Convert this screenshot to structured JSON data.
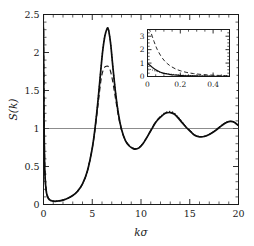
{
  "chart_data": {
    "type": "line",
    "title": "",
    "xlabel": "kσ",
    "ylabel": "S(k)",
    "xlim": [
      0,
      20
    ],
    "ylim": [
      0,
      2.5
    ],
    "grid": false,
    "legend_position": "none",
    "reference_lines": [
      {
        "axis": "y",
        "value": 1,
        "style": "solid-thin"
      }
    ],
    "x_ticks": [
      0,
      5,
      10,
      15,
      20
    ],
    "x_tick_labels": [
      "0",
      "5",
      "10",
      "15",
      "20"
    ],
    "x_minor_tick_step": 1,
    "y_ticks": [
      0,
      0.5,
      1,
      1.5,
      2,
      2.5
    ],
    "y_tick_labels": [
      "0",
      "0.5",
      "1",
      "1.5",
      "2",
      "2.5"
    ],
    "y_minor_tick_step": 0.1,
    "series": [
      {
        "name": "solid",
        "style": "solid",
        "x": [
          0.0,
          0.05,
          0.1,
          0.15,
          0.2,
          0.3,
          0.4,
          0.5,
          0.7,
          0.9,
          1.2,
          1.6,
          2.0,
          2.5,
          3.0,
          3.5,
          4.0,
          4.5,
          5.0,
          5.3,
          5.6,
          5.9,
          6.1,
          6.3,
          6.5,
          6.6,
          6.7,
          6.9,
          7.1,
          7.4,
          7.7,
          8.0,
          8.4,
          8.8,
          9.2,
          9.5,
          9.8,
          10.2,
          10.6,
          11.0,
          11.5,
          12.0,
          12.5,
          13.0,
          13.4,
          13.8,
          14.2,
          14.6,
          15.0,
          15.5,
          16.0,
          16.5,
          17.0,
          17.5,
          18.0,
          18.5,
          19.0,
          19.4,
          19.7,
          20.0
        ],
        "y": [
          2.32,
          1.15,
          0.62,
          0.4,
          0.28,
          0.16,
          0.11,
          0.08,
          0.055,
          0.046,
          0.042,
          0.047,
          0.058,
          0.082,
          0.118,
          0.175,
          0.27,
          0.44,
          0.74,
          1.02,
          1.38,
          1.8,
          2.05,
          2.22,
          2.31,
          2.32,
          2.28,
          2.1,
          1.83,
          1.46,
          1.18,
          0.99,
          0.84,
          0.77,
          0.735,
          0.73,
          0.745,
          0.8,
          0.88,
          0.97,
          1.08,
          1.15,
          1.2,
          1.21,
          1.19,
          1.14,
          1.08,
          1.02,
          0.97,
          0.91,
          0.89,
          0.895,
          0.92,
          0.96,
          1.01,
          1.06,
          1.09,
          1.09,
          1.07,
          1.04
        ]
      },
      {
        "name": "dashed",
        "style": "dashed",
        "x": [
          0.0,
          0.05,
          0.1,
          0.15,
          0.2,
          0.3,
          0.4,
          0.5,
          0.7,
          0.9,
          1.2,
          1.6,
          2.0,
          2.5,
          3.0,
          3.5,
          4.0,
          4.5,
          5.0,
          5.3,
          5.6,
          5.9,
          6.1,
          6.3,
          6.5,
          6.6,
          6.75,
          6.9,
          7.1,
          7.4,
          7.7,
          8.0,
          8.4,
          8.8,
          9.2,
          9.5,
          9.8,
          10.2,
          10.6,
          11.0,
          11.5,
          12.0,
          12.5,
          13.0,
          13.4,
          13.8,
          14.2,
          14.6,
          15.0,
          15.5,
          16.0,
          16.5,
          17.0,
          17.5,
          18.0,
          18.5,
          19.0,
          19.4,
          19.7,
          20.0
        ],
        "y": [
          3.4,
          1.6,
          0.8,
          0.48,
          0.33,
          0.18,
          0.12,
          0.088,
          0.058,
          0.048,
          0.043,
          0.048,
          0.059,
          0.083,
          0.119,
          0.176,
          0.271,
          0.44,
          0.74,
          1.0,
          1.32,
          1.64,
          1.76,
          1.81,
          1.82,
          1.82,
          1.8,
          1.74,
          1.62,
          1.38,
          1.15,
          0.98,
          0.845,
          0.775,
          0.74,
          0.735,
          0.75,
          0.805,
          0.885,
          0.975,
          1.085,
          1.155,
          1.205,
          1.215,
          1.195,
          1.145,
          1.085,
          1.025,
          0.975,
          0.915,
          0.893,
          0.898,
          0.923,
          0.963,
          1.013,
          1.062,
          1.092,
          1.092,
          1.072,
          1.042
        ]
      },
      {
        "name": "dotted",
        "style": "dotted",
        "x": [
          0.0,
          0.05,
          0.1,
          0.15,
          0.2,
          0.3,
          0.4,
          0.5,
          0.7,
          0.9,
          1.2,
          1.6,
          2.0,
          2.5,
          3.0,
          3.5,
          4.0,
          4.5,
          5.0,
          5.3,
          5.6,
          5.9,
          6.1,
          6.3,
          6.5,
          6.6,
          6.7,
          6.9,
          7.1,
          7.4,
          7.7,
          8.0,
          8.4,
          8.8,
          9.2,
          9.5,
          9.8,
          10.2,
          10.6,
          11.0,
          11.5,
          12.0,
          12.5,
          13.0,
          13.4,
          13.8,
          14.2,
          14.6,
          15.0,
          15.5,
          16.0,
          16.5,
          17.0,
          17.5,
          18.0,
          18.5,
          19.0,
          19.4,
          19.7,
          20.0
        ],
        "y": [
          0.95,
          0.66,
          0.47,
          0.34,
          0.26,
          0.155,
          0.108,
          0.082,
          0.056,
          0.046,
          0.042,
          0.047,
          0.058,
          0.082,
          0.118,
          0.175,
          0.27,
          0.44,
          0.745,
          1.03,
          1.39,
          1.81,
          2.06,
          2.23,
          2.31,
          2.325,
          2.285,
          2.105,
          1.835,
          1.465,
          1.185,
          0.995,
          0.845,
          0.775,
          0.74,
          0.735,
          0.75,
          0.805,
          0.885,
          0.975,
          1.085,
          1.16,
          1.21,
          1.225,
          1.205,
          1.15,
          1.09,
          1.025,
          0.975,
          0.915,
          0.893,
          0.898,
          0.923,
          0.963,
          1.013,
          1.062,
          1.092,
          1.092,
          1.072,
          1.042
        ]
      }
    ],
    "inset": {
      "xlabel": "",
      "ylabel": "",
      "xlim": [
        0,
        0.5
      ],
      "ylim": [
        0,
        3.5
      ],
      "x_ticks": [
        0,
        0.2,
        0.4
      ],
      "x_tick_labels": [
        "0",
        "0.2",
        "0.4"
      ],
      "x_minor_tick_step": 0.05,
      "y_ticks": [
        0,
        1,
        2,
        3
      ],
      "y_tick_labels": [
        "0",
        "1",
        "2",
        "3"
      ],
      "y_minor_tick_step": 0.25,
      "series": [
        {
          "name": "solid",
          "style": "solid",
          "x": [
            0.0,
            0.01,
            0.02,
            0.03,
            0.05,
            0.07,
            0.09,
            0.11,
            0.13,
            0.15,
            0.18,
            0.21,
            0.25,
            0.3,
            0.35,
            0.4,
            0.45,
            0.5
          ],
          "y": [
            0.96,
            0.88,
            0.78,
            0.68,
            0.5,
            0.37,
            0.275,
            0.21,
            0.165,
            0.13,
            0.095,
            0.072,
            0.05,
            0.035,
            0.026,
            0.02,
            0.016,
            0.013
          ]
        },
        {
          "name": "dashed",
          "style": "dashed",
          "x": [
            0.0,
            0.01,
            0.02,
            0.03,
            0.04,
            0.05,
            0.06,
            0.08,
            0.1,
            0.12,
            0.14,
            0.17,
            0.2,
            0.24,
            0.28,
            0.33,
            0.38,
            0.44,
            0.5
          ],
          "y": [
            3.5,
            3.48,
            3.3,
            2.95,
            2.6,
            2.28,
            2.0,
            1.56,
            1.22,
            0.97,
            0.78,
            0.57,
            0.43,
            0.3,
            0.22,
            0.15,
            0.11,
            0.08,
            0.06
          ]
        },
        {
          "name": "dotted",
          "style": "dotted",
          "x": [
            0.0,
            0.01,
            0.02,
            0.03,
            0.05,
            0.07,
            0.09,
            0.11,
            0.14,
            0.17,
            0.2,
            0.25,
            0.3,
            0.36,
            0.42,
            0.5
          ],
          "y": [
            0.6,
            0.56,
            0.52,
            0.48,
            0.4,
            0.335,
            0.28,
            0.235,
            0.18,
            0.14,
            0.11,
            0.075,
            0.052,
            0.035,
            0.025,
            0.018
          ]
        }
      ]
    }
  },
  "labels": {
    "y_axis_title": "S(k)",
    "x_axis_title": "kσ"
  }
}
